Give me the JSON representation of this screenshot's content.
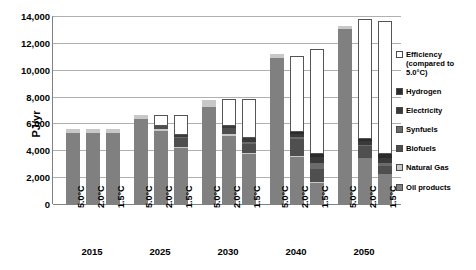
{
  "chart_data": {
    "type": "bar",
    "stacked": true,
    "title": "",
    "xlabel": "",
    "ylabel": "PJ/yr",
    "ylim": [
      0,
      14000
    ],
    "ytick_labels": [
      "0",
      "2,000",
      "4,000",
      "6,000",
      "8,000",
      "10,000",
      "12,000",
      "14,000"
    ],
    "ytick_values": [
      0,
      2000,
      4000,
      6000,
      8000,
      10000,
      12000,
      14000
    ],
    "grid": true,
    "legend_position": "right",
    "groups": [
      "2015",
      "2025",
      "2030",
      "2040",
      "2050"
    ],
    "scenarios": [
      "5.0°C",
      "2.0°C",
      "1.5°C"
    ],
    "series": [
      {
        "name": "Oil products",
        "color": "#808080",
        "values": [
          5300,
          5300,
          5300,
          6300,
          5450,
          4150,
          7200,
          5050,
          3700,
          10850,
          3500,
          1600,
          13000,
          3400,
          2200
        ]
      },
      {
        "name": "Natural Gas",
        "color": "#c8c8c8",
        "values": [
          300,
          300,
          300,
          300,
          150,
          100,
          550,
          200,
          100,
          350,
          100,
          50,
          250,
          50,
          50
        ]
      },
      {
        "name": "Biofuels",
        "color": "#4f4f4f",
        "values": [
          0,
          0,
          0,
          0,
          200,
          700,
          0,
          400,
          700,
          0,
          1250,
          950,
          0,
          850,
          600
        ]
      },
      {
        "name": "Synfuels",
        "color": "#6b6b6b",
        "values": [
          0,
          0,
          0,
          0,
          0,
          80,
          0,
          0,
          150,
          0,
          150,
          450,
          0,
          100,
          200
        ]
      },
      {
        "name": "Electricity",
        "color": "#3a3a3a",
        "values": [
          0,
          0,
          0,
          0,
          50,
          150,
          0,
          150,
          250,
          0,
          250,
          450,
          0,
          300,
          350
        ]
      },
      {
        "name": "Hydrogen",
        "color": "#2b2b2b",
        "values": [
          0,
          0,
          0,
          0,
          0,
          0,
          0,
          0,
          50,
          0,
          100,
          250,
          0,
          150,
          300
        ]
      },
      {
        "name": "Efficiency (compared to 5.0°C)",
        "color": "#ffffff",
        "values": [
          0,
          0,
          0,
          0,
          750,
          1450,
          0,
          2000,
          2850,
          0,
          5700,
          7800,
          0,
          8900,
          9950
        ]
      }
    ]
  },
  "axis": {
    "y_title": "PJ/yr"
  },
  "legend": {
    "items": [
      {
        "label": "Efficiency (compared to 5.0°C)",
        "swatch": "#ffffff",
        "name": "legend-efficiency"
      },
      {
        "label": "Hydrogen",
        "swatch": "#2b2b2b",
        "name": "legend-hydrogen"
      },
      {
        "label": "Electricity",
        "swatch": "#3a3a3a",
        "name": "legend-electricity"
      },
      {
        "label": "Synfuels",
        "swatch": "#6b6b6b",
        "name": "legend-synfuels"
      },
      {
        "label": "Biofuels",
        "swatch": "#4f4f4f",
        "name": "legend-biofuels"
      },
      {
        "label": "Natural Gas",
        "swatch": "#c8c8c8",
        "name": "legend-natural-gas"
      },
      {
        "label": "Oil products",
        "swatch": "#808080",
        "name": "legend-oil-products"
      }
    ]
  },
  "colors": {
    "gridline": "#b0b0b0",
    "axis": "#808080",
    "text": "#000000"
  }
}
